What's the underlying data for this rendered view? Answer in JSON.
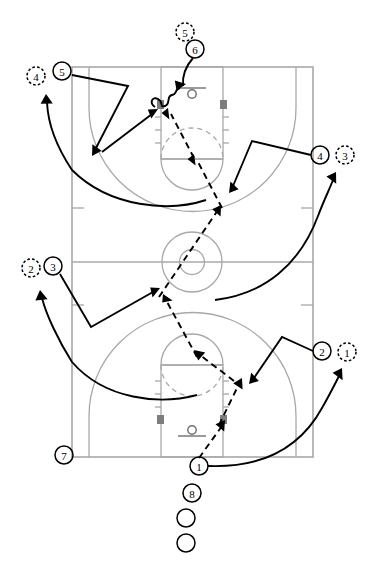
{
  "diagram": {
    "type": "full-court-play",
    "court": {
      "orientation": "vertical",
      "line_color": "#a8a8a8",
      "block_color": "#7d7d7d",
      "bounds": {
        "x": 72,
        "y": 67,
        "width": 241,
        "height": 390
      },
      "features": [
        "sideline-boundary",
        "half-court-line",
        "center-circle",
        "center-inner-circle",
        "top-key",
        "top-free-throw-circle",
        "top-three-point-arc",
        "top-hoop",
        "top-backboard",
        "bottom-key",
        "bottom-free-throw-circle",
        "bottom-three-point-arc",
        "bottom-hoop",
        "bottom-backboard",
        "lane-blocks",
        "lane-hash-marks",
        "sideline-hash-marks"
      ]
    },
    "markers": [
      {
        "id": "m5-dashed",
        "label": "5",
        "style": "dashed",
        "cx": 185,
        "cy": 32,
        "r": 9
      },
      {
        "id": "m6-solid",
        "label": "6",
        "style": "solid",
        "cx": 195,
        "cy": 49,
        "r": 9
      },
      {
        "id": "m4-dashed",
        "label": "4",
        "style": "dashed",
        "cx": 36,
        "cy": 76,
        "r": 9
      },
      {
        "id": "m5-solid",
        "label": "5",
        "style": "solid",
        "cx": 62,
        "cy": 71,
        "r": 9
      },
      {
        "id": "m4-solid",
        "label": "4",
        "style": "solid",
        "cx": 320,
        "cy": 155,
        "r": 9
      },
      {
        "id": "m3-dashed",
        "label": "3",
        "style": "dashed",
        "cx": 345,
        "cy": 155,
        "r": 9
      },
      {
        "id": "m2-dashed",
        "label": "2",
        "style": "dashed",
        "cx": 31,
        "cy": 268,
        "r": 9
      },
      {
        "id": "m3-solid",
        "label": "3",
        "style": "solid",
        "cx": 53,
        "cy": 266,
        "r": 9
      },
      {
        "id": "m2-solid",
        "label": "2",
        "style": "solid",
        "cx": 322,
        "cy": 351,
        "r": 9
      },
      {
        "id": "m1-dashed",
        "label": "1",
        "style": "dashed",
        "cx": 347,
        "cy": 352,
        "r": 9
      },
      {
        "id": "m7-solid",
        "label": "7",
        "style": "solid",
        "cx": 64,
        "cy": 455,
        "r": 9
      },
      {
        "id": "m1-solid",
        "label": "1",
        "style": "solid",
        "cx": 199,
        "cy": 466,
        "r": 9
      },
      {
        "id": "m8-solid",
        "label": "8",
        "style": "solid",
        "cx": 192,
        "cy": 493,
        "r": 9
      },
      {
        "id": "m-queue-1",
        "label": "",
        "style": "solid",
        "cx": 186,
        "cy": 518,
        "r": 9
      },
      {
        "id": "m-queue-2",
        "label": "",
        "style": "solid",
        "cx": 186,
        "cy": 543,
        "r": 9
      }
    ],
    "legend": {
      "solid_circle": "player position",
      "dashed_circle": "next position / destination",
      "solid_arrow": "player cut / movement",
      "dashed_arrow": "pass",
      "zigzag_arrow": "dribble"
    },
    "movements": [
      {
        "id": "pass-1-to-block",
        "kind": "pass",
        "from": "1",
        "to": "bottom-right-block"
      },
      {
        "id": "pass-block-to-ft",
        "kind": "pass",
        "to": "bottom-free-throw"
      },
      {
        "id": "pass-ft-to-center",
        "kind": "pass",
        "to": "center-circle"
      },
      {
        "id": "pass-center-to-top-elbow",
        "kind": "pass",
        "to": "top-right-elbow"
      },
      {
        "id": "pass-elbow-to-top-block",
        "kind": "pass",
        "to": "top-left-block"
      },
      {
        "id": "dribble-to-hoop",
        "kind": "dribble",
        "to": "top-hoop"
      },
      {
        "id": "cut-5-down-left",
        "kind": "cut",
        "player": "5"
      },
      {
        "id": "cut-left-to-block",
        "kind": "cut",
        "to": "top-left-block"
      },
      {
        "id": "cut-4-to-wing",
        "kind": "cut",
        "player": "4"
      },
      {
        "id": "fill-4-up-left-arc",
        "kind": "fill",
        "player": "4"
      },
      {
        "id": "cut-3-to-center",
        "kind": "cut",
        "player": "3"
      },
      {
        "id": "fill-2-up-left-arc",
        "kind": "fill",
        "player": "2"
      },
      {
        "id": "cut-2-to-block",
        "kind": "cut",
        "player": "2"
      },
      {
        "id": "fill-1-up-right-arc",
        "kind": "fill",
        "player": "1"
      }
    ]
  }
}
